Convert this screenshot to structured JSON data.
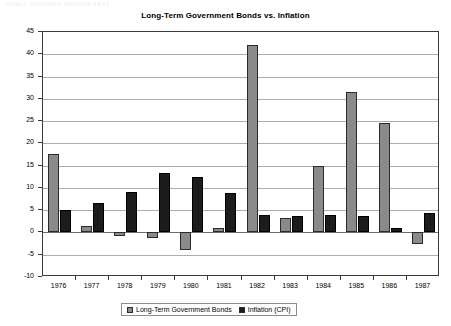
{
  "ghost_text": "SMALL SCANNED HEADER TEXT",
  "chart_data": {
    "type": "bar",
    "title": "Long-Term Government Bonds vs. Inflation",
    "xlabel": "",
    "ylabel": "",
    "ylim": [
      -10,
      45
    ],
    "ytick_step": 5,
    "yticks": [
      45,
      40,
      35,
      30,
      25,
      20,
      15,
      10,
      5,
      0,
      -5,
      -10
    ],
    "ytick_labels": [
      "45",
      "40",
      "35",
      "30",
      "25",
      "20",
      "15",
      "10",
      "5",
      "0",
      "-5",
      "-10"
    ],
    "grid": true,
    "legend_position": "bottom",
    "categories": [
      "1976",
      "1977",
      "1978",
      "1979",
      "1980",
      "1981",
      "1982",
      "1983",
      "1984",
      "1985",
      "1986",
      "1987"
    ],
    "series": [
      {
        "name": "Long-Term Government Bonds",
        "color": "#8a8a8a",
        "values": [
          17.7,
          1.4,
          -0.7,
          -1.2,
          -3.9,
          1.0,
          42.0,
          3.2,
          15.0,
          31.5,
          24.5,
          -2.7
        ]
      },
      {
        "name": "Inflation (CPI)",
        "color": "#1c1c1c",
        "values": [
          5.0,
          6.7,
          9.0,
          13.3,
          12.4,
          8.9,
          3.9,
          3.8,
          4.0,
          3.8,
          1.1,
          4.4
        ]
      }
    ]
  }
}
